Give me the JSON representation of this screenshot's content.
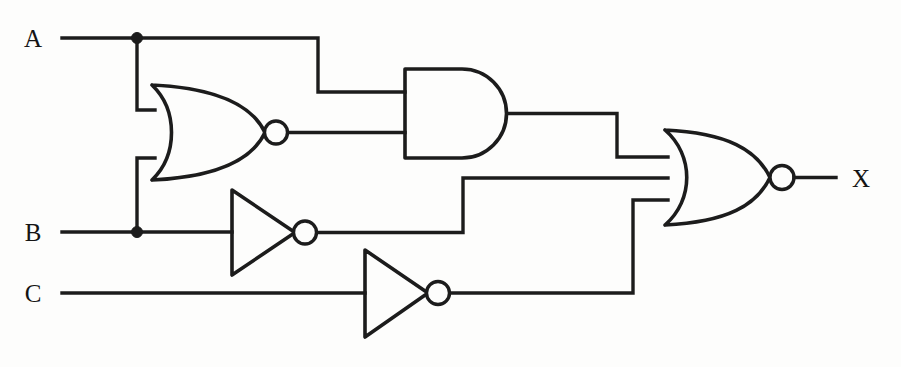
{
  "diagram": {
    "type": "logic-gate-schematic",
    "background_color": "#fdfdfc",
    "line_color": "#1c1c1c",
    "width": 901,
    "height": 367
  },
  "labels": {
    "input_a": "A",
    "input_b": "B",
    "input_c": "C",
    "output_x": "X"
  },
  "pins": [
    {
      "name": "A",
      "label": "A",
      "role": "input",
      "x": 40,
      "y": 46
    },
    {
      "name": "B",
      "label": "B",
      "role": "input",
      "x": 38,
      "y": 240
    },
    {
      "name": "C",
      "label": "C",
      "role": "input",
      "x": 38,
      "y": 300
    },
    {
      "name": "X",
      "label": "X",
      "role": "output",
      "x": 852,
      "y": 186
    }
  ],
  "gates": [
    {
      "id": "nor1",
      "type": "NOR",
      "inputs": [
        "A",
        "B"
      ],
      "output": "n1",
      "input_count": 2,
      "x": 152,
      "y": 85,
      "width": 125,
      "height": 95
    },
    {
      "id": "and1",
      "type": "AND",
      "inputs": [
        "A",
        "n1"
      ],
      "output": "n2",
      "input_count": 2,
      "x": 405,
      "y": 69,
      "width": 105,
      "height": 89
    },
    {
      "id": "inv1",
      "type": "NOT",
      "inputs": [
        "B"
      ],
      "output": "n3",
      "input_count": 1,
      "x": 232,
      "y": 190,
      "width": 63,
      "height": 85
    },
    {
      "id": "inv2",
      "type": "NOT",
      "inputs": [
        "C"
      ],
      "output": "n4",
      "input_count": 1,
      "x": 365,
      "y": 250,
      "width": 63,
      "height": 87
    },
    {
      "id": "nor2",
      "type": "NOR",
      "inputs": [
        "n2",
        "n3",
        "n4"
      ],
      "output": "X",
      "input_count": 3,
      "x": 665,
      "y": 130,
      "width": 115,
      "height": 95
    }
  ],
  "junctions": [
    {
      "name": "junction-a",
      "signal": "A",
      "x": 137,
      "y": 38
    },
    {
      "name": "junction-b",
      "signal": "B",
      "x": 137,
      "y": 232
    }
  ],
  "nets": [
    {
      "name": "net-a-trunk",
      "from": "A",
      "to": "junction-a / nor1-in1 / and1-in1"
    },
    {
      "name": "net-b-trunk",
      "from": "B",
      "to": "junction-b / nor1-in2 / inv1-in"
    },
    {
      "name": "net-c-trunk",
      "from": "C",
      "to": "inv2-in"
    },
    {
      "name": "net-nor1-out",
      "from": "nor1",
      "to": "and1-in2"
    },
    {
      "name": "net-and1-out",
      "from": "and1",
      "to": "nor2-in1"
    },
    {
      "name": "net-inv1-out",
      "from": "inv1",
      "to": "nor2-in2"
    },
    {
      "name": "net-inv2-out",
      "from": "inv2",
      "to": "nor2-in3"
    },
    {
      "name": "net-x-out",
      "from": "nor2",
      "to": "X"
    }
  ]
}
